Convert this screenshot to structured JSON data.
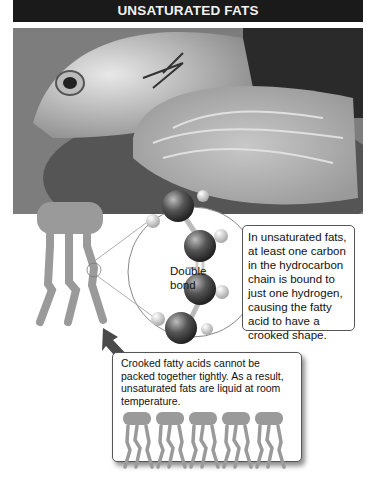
{
  "title": "UNSATURATED FATS",
  "photo": {
    "description": "fish-and-salmon-steak-photo"
  },
  "labels": {
    "double_bond_line1": "Double",
    "double_bond_line2": "bond"
  },
  "info_box": {
    "text": "In unsaturated fats, at least one carbon in the hydrocarbon chain is bound to just one hydrogen, causing the fatty acid to have a crooked shape."
  },
  "bottom_box": {
    "text": "Crooked fatty acids cannot be packed together tightly. As a result, unsaturated fats are liquid at room temperature.",
    "molecule_count": 5
  },
  "colors": {
    "title_bg": "#1a1a1a",
    "molecule_fill": "#9a9a9a",
    "carbon_atom": "#444444",
    "hydrogen_atom": "#d8d8d8"
  }
}
